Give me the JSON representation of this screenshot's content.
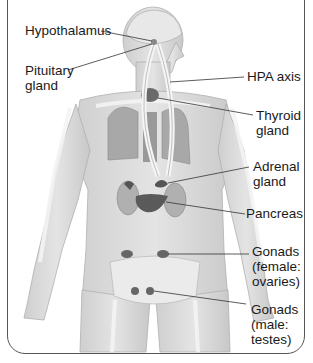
{
  "diagram": {
    "labels": {
      "hypothalamus": "Hypothalamus",
      "pituitary_1": "Pituitary",
      "pituitary_2": "gland",
      "hpa_axis": "HPA axis",
      "thyroid_1": "Thyroid",
      "thyroid_2": "gland",
      "adrenal_1": "Adrenal",
      "adrenal_2": "gland",
      "pancreas": "Pancreas",
      "gonads_f_1": "Gonads",
      "gonads_f_2": "(female:",
      "gonads_f_3": "ovaries)",
      "gonads_m_1": "Gonads",
      "gonads_m_2": "(male:",
      "gonads_m_3": "testes)"
    },
    "colors": {
      "skin": "#d9d9d9",
      "bone": "#f2f2f2",
      "organ": "#9a9a9a",
      "gland": "#666666",
      "leader": "#333333"
    }
  }
}
